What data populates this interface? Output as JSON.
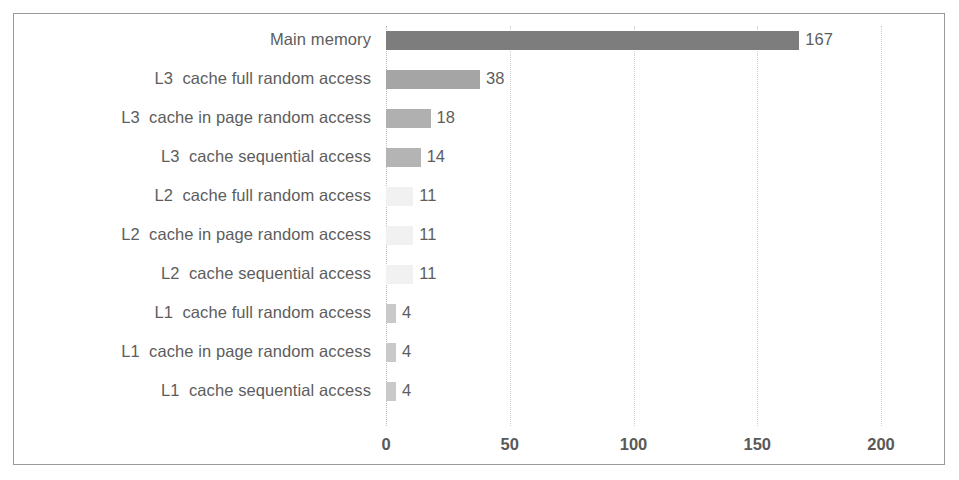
{
  "chart_data": {
    "type": "bar",
    "orientation": "horizontal",
    "title": "",
    "xlabel": "",
    "ylabel": "",
    "xlim": [
      0,
      200
    ],
    "xticks": [
      "0",
      "50",
      "100",
      "150",
      "200"
    ],
    "grid": true,
    "legend": "none",
    "categories": [
      "Main memory",
      "L3  cache full random access",
      "L3  cache in page random access",
      "L3  cache sequential access",
      "L2  cache full random access",
      "L2  cache in page random access",
      "L2  cache sequential access",
      "L1  cache full random access",
      "L1  cache in page random access",
      "L1  cache sequential access"
    ],
    "values": [
      167,
      38,
      18,
      14,
      11,
      11,
      11,
      4,
      4,
      4
    ],
    "value_labels": [
      "167",
      "38",
      "18",
      "14",
      "11",
      "11",
      "11",
      "4",
      "4",
      "4"
    ],
    "bar_colors": [
      "#7d7d7d",
      "#a5a5a5",
      "#b0b0b0",
      "#b4b4b4",
      "#f1f1f1",
      "#f1f1f1",
      "#f1f1f1",
      "#c9c9c9",
      "#c9c9c9",
      "#c9c9c9"
    ]
  },
  "colors": {
    "frame_border": "#9a9a9a",
    "gridline": "#cfcfcf",
    "label_text": "#5d5d5d",
    "tick_text": "#595959",
    "background": "#ffffff"
  }
}
